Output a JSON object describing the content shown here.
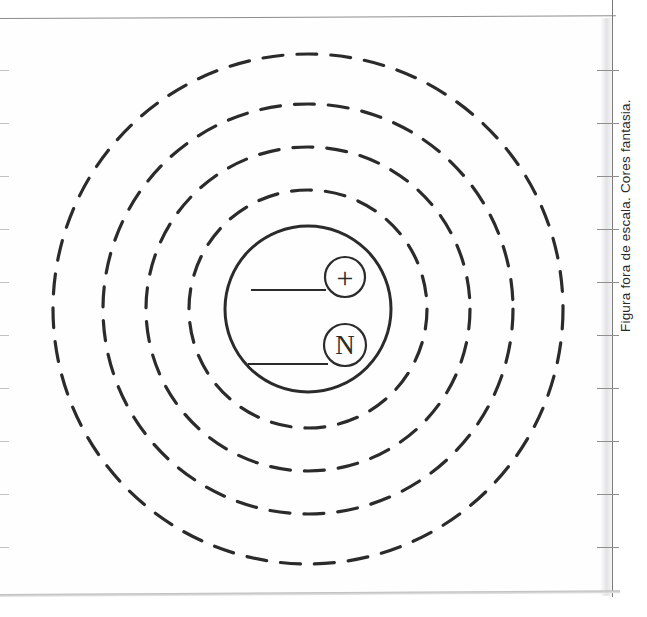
{
  "page": {
    "caption": "Figura fora de escala. Cores fantasia.",
    "background_color": "#ffffff",
    "ink_color": "#2b2b2b",
    "rule_color": "#8d8d8d"
  },
  "figure": {
    "name": "atom-model-diagram",
    "center": {
      "x": 308,
      "y": 309
    },
    "nucleus": {
      "radius": 83,
      "stroke_width": 3,
      "style": "solid"
    },
    "shells": [
      {
        "label": "shell-1",
        "radius": 119
      },
      {
        "label": "shell-2",
        "radius": 162
      },
      {
        "label": "shell-3",
        "radius": 205
      },
      {
        "label": "shell-4",
        "radius": 255
      }
    ],
    "shell_style": {
      "dash": 20,
      "gap": 14,
      "stroke_width": 3.2
    },
    "particles": [
      {
        "name": "proton",
        "symbol": "+",
        "cx": 345,
        "cy": 277,
        "r": 20,
        "leader": {
          "x1": 251,
          "y1": 290,
          "x2": 326,
          "y2": 290
        }
      },
      {
        "name": "neutron",
        "symbol": "N",
        "cx": 345,
        "cy": 345,
        "r": 21,
        "leader": {
          "x1": 248,
          "y1": 364,
          "x2": 328,
          "y2": 364
        }
      }
    ]
  },
  "ruler": {
    "left_ticks_y": [
      70,
      123,
      176,
      229,
      282,
      335,
      388,
      441,
      494,
      547
    ],
    "right_ticks_y": [
      70,
      123,
      176,
      229,
      282,
      335,
      388,
      441,
      494,
      547
    ]
  }
}
